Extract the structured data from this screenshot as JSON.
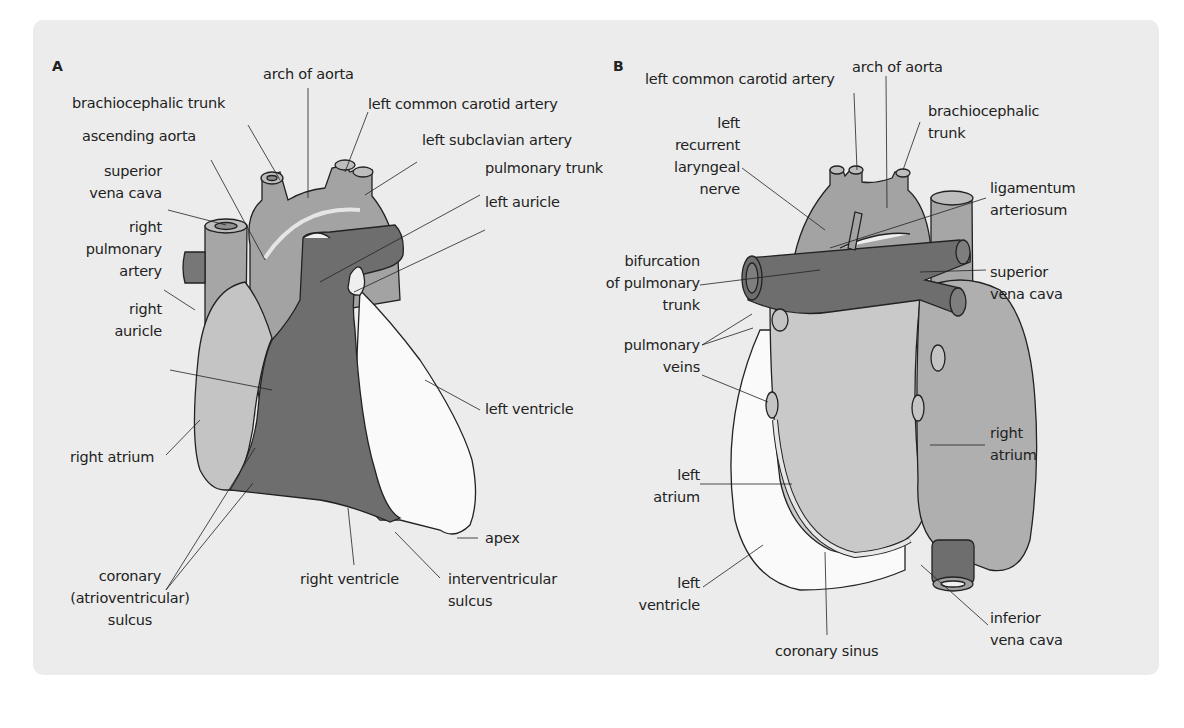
{
  "colors": {
    "background": "#ececec",
    "aorta": "#a3a3a3",
    "pulmonary": "#6e6e6e",
    "right_atrium": "#c4c4c4",
    "left_ventricle": "#fafafa",
    "outline": "#222222"
  },
  "panel_a": {
    "letter": "A",
    "labels": {
      "arch_of_aorta": "arch of aorta",
      "brachiocephalic_trunk": "brachiocephalic trunk",
      "left_common_carotid_artery": "left common carotid artery",
      "ascending_aorta": "ascending aorta",
      "left_subclavian_artery": "left subclavian artery",
      "superior_vena_cava": "superior\nvena cava",
      "pulmonary_trunk": "pulmonary trunk",
      "left_auricle": "left auricle",
      "right_pulmonary_artery": "right\npulmonary\nartery",
      "right_auricle": "right\nauricle",
      "left_ventricle": "left ventricle",
      "right_atrium": "right atrium",
      "apex": "apex",
      "coronary_sulcus": "coronary\n(atrioventricular)\nsulcus",
      "right_ventricle": "right ventricle",
      "interventricular_sulcus": "interventricular\nsulcus"
    }
  },
  "panel_b": {
    "letter": "B",
    "labels": {
      "left_common_carotid_artery": "left common carotid artery",
      "arch_of_aorta": "arch of aorta",
      "brachiocephalic_trunk": "brachiocephalic\ntrunk",
      "left_recurrent_laryngeal_nerve": "left\nrecurrent\nlaryngeal\nnerve",
      "ligamentum_arteriosum": "ligamentum\narteriosum",
      "bifurcation_of_pulmonary_trunk": "bifurcation\nof pulmonary\ntrunk",
      "superior_vena_cava": "superior\nvena cava",
      "pulmonary_veins": "pulmonary\nveins",
      "right_atrium": "right\natrium",
      "left_atrium": "left\natrium",
      "left_ventricle": "left\nventricle",
      "inferior_vena_cava": "inferior\nvena cava",
      "coronary_sinus": "coronary sinus"
    }
  }
}
